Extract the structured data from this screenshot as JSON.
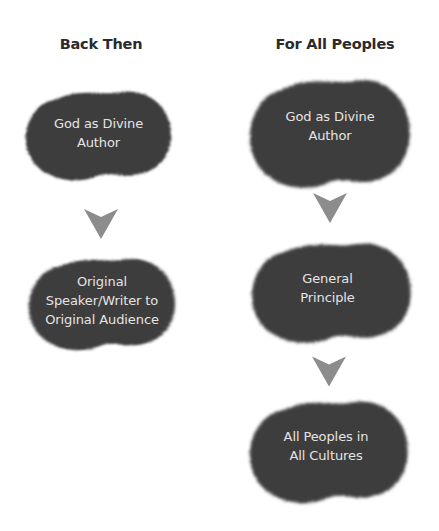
{
  "colors": {
    "blob_fill": "#3e3e3e",
    "blob_text": "#e4e4e4",
    "arrow_fill": "#8c8c8c",
    "heading_text": "#2b2b2b",
    "background": "#ffffff"
  },
  "columns": [
    {
      "heading": "Back Then",
      "nodes": [
        {
          "label": "God as Divine\nAuthor"
        },
        {
          "label": "Original\nSpeaker/Writer to\nOriginal Audience"
        }
      ],
      "arrows": [
        "down-arrow"
      ]
    },
    {
      "heading": "For All Peoples",
      "nodes": [
        {
          "label": "God as Divine\nAuthor"
        },
        {
          "label": "General\nPrinciple"
        },
        {
          "label": "All Peoples in\nAll Cultures"
        }
      ],
      "arrows": [
        "down-arrow",
        "down-arrow"
      ]
    }
  ]
}
